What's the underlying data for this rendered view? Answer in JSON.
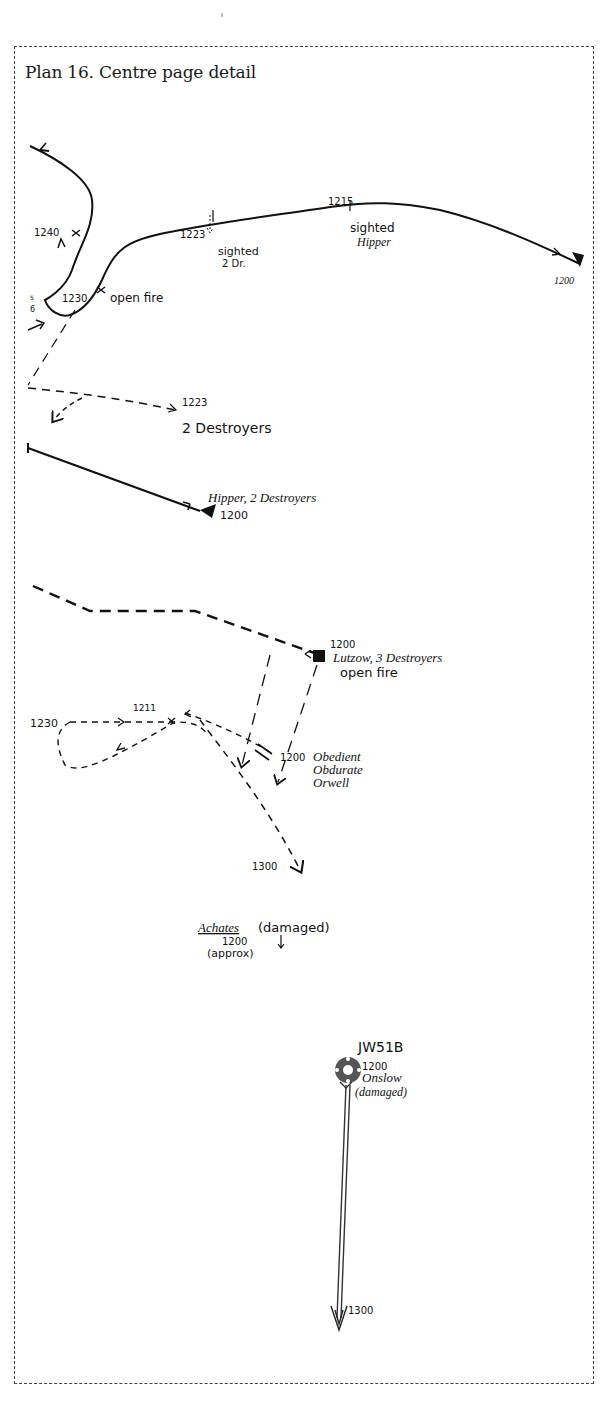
{
  "title": "Plan 16. Centre page detail",
  "colors": {
    "ink": "#111111",
    "frame": "#444444",
    "background": "#ffffff"
  },
  "onslow_track": {
    "times": {
      "t1240": "1240",
      "t1230": "1230",
      "t1223": "1223",
      "t1215": "1215",
      "t1200": "1200"
    },
    "small_marks": {
      "a": "5",
      "b": "6"
    },
    "notes": {
      "open_fire": "open fire",
      "sighted": "sighted",
      "two_dr": "2 Dr.",
      "sighted2": "sighted",
      "hipper": "Hipper"
    }
  },
  "two_destroyers": {
    "time": "1223",
    "label": "2 Destroyers"
  },
  "hipper_group": {
    "label": "Hipper, 2 Destroyers",
    "time": "1200"
  },
  "lutzow_group": {
    "time": "1200",
    "label": "Lutzow, 3 Destroyers",
    "note": "open fire"
  },
  "destroyer_group": {
    "time_1230": "1230",
    "time_1211": "1211",
    "time_1200": "1200",
    "time_1300": "1300",
    "ships": [
      "Obedient",
      "Obdurate",
      "Orwell"
    ]
  },
  "achates": {
    "name": "Achates",
    "status": "(damaged)",
    "time": "1200",
    "note": "(approx)"
  },
  "convoy": {
    "name": "JW51B",
    "time": "1200",
    "ship": "Onslow",
    "status": "(damaged)",
    "end_time": "1300"
  }
}
